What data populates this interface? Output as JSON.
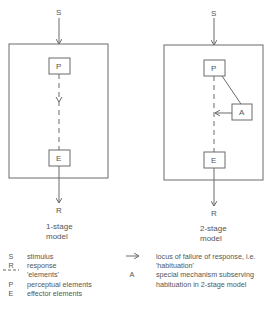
{
  "models": [
    {
      "id": "one-stage",
      "input_label": "S",
      "perceptual_label": "P",
      "effector_label": "E",
      "output_label": "R",
      "caption_line1": "1-stage",
      "caption_line2": "model"
    },
    {
      "id": "two-stage",
      "input_label": "S",
      "perceptual_label": "P",
      "mechanism_label": "A",
      "effector_label": "E",
      "output_label": "R",
      "caption_line1": "2-stage",
      "caption_line2": "model"
    }
  ],
  "legend": {
    "left": [
      {
        "symbol": "S",
        "text": "stimulus"
      },
      {
        "symbol": "R",
        "text": "response"
      },
      {
        "symbol": "---",
        "text": "'elements'"
      },
      {
        "symbol": "P",
        "text": "perceptual elements"
      },
      {
        "symbol": "E",
        "text": "effector elements"
      }
    ],
    "right": [
      {
        "symbol": "→",
        "text": "locus of failure of response, i.e. 'habituation'"
      },
      {
        "symbol": "A",
        "text": "special mechanism subserving habituation in 2-stage model"
      }
    ]
  },
  "colors": {
    "line": "#6a6a6a",
    "text": "#555555"
  }
}
